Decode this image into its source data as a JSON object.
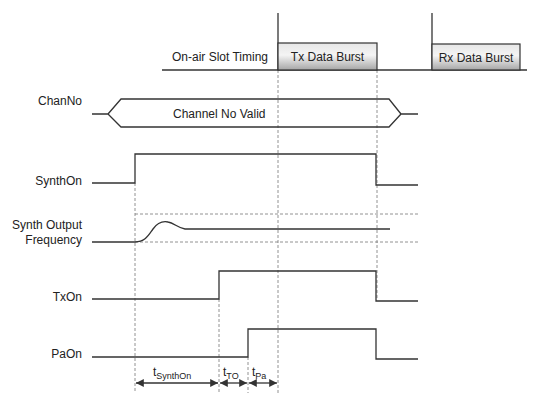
{
  "diagram": {
    "type": "timing-diagram",
    "slot_timing": {
      "label": "On-air Slot Timing",
      "tx_burst_label": "Tx Data Burst",
      "rx_burst_label": "Rx Data Burst"
    },
    "signals": {
      "chan_no": {
        "label": "ChanNo",
        "valid_label": "Channel No Valid"
      },
      "synth_on": {
        "label": "SynthOn"
      },
      "synth_freq": {
        "label_line1": "Synth Output",
        "label_line2": "Frequency"
      },
      "tx_on": {
        "label": "TxOn"
      },
      "pa_on": {
        "label": "PaOn"
      }
    },
    "intervals": [
      {
        "base": "t",
        "sub": "SynthOn"
      },
      {
        "base": "t",
        "sub": "TO"
      },
      {
        "base": "t",
        "sub": "Pa"
      }
    ],
    "colors": {
      "line": "#333333",
      "burst_fill_top": "#f2f2f2",
      "burst_fill_bottom": "#a8a8a8"
    }
  }
}
